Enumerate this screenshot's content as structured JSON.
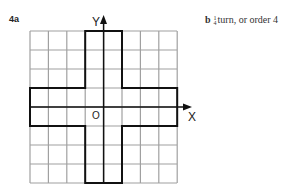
{
  "part_a": {
    "label": "4a"
  },
  "part_b": {
    "label": "b",
    "frac_num": "1",
    "frac_den": "4",
    "text": "turn, or order 4"
  },
  "axes": {
    "y_label": "Y",
    "x_label": "X",
    "origin_label": "O"
  },
  "grid": {
    "cols": 8,
    "rows": 8,
    "color": "#9a9a9a"
  }
}
